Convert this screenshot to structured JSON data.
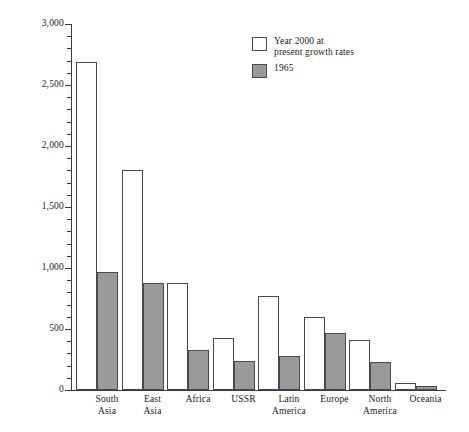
{
  "chart_data": {
    "type": "bar",
    "title": "",
    "subtitle": "",
    "xlabel": "",
    "ylabel": "Millions",
    "ylim": [
      0,
      3000
    ],
    "y_major_step": 500,
    "y_minor_step": 100,
    "grid": false,
    "legend_position": "top-right",
    "y_tick_labels": [
      "3,000",
      "2,500",
      "2,000",
      "1,500",
      "1,000",
      "500",
      "0"
    ],
    "y_tick_values": [
      3000,
      2500,
      2000,
      1500,
      1000,
      500,
      0
    ],
    "categories": [
      "South\nAsia",
      "East\nAsia",
      "Africa",
      "USSR",
      "Latin\nAmerica",
      "Europe",
      "North\nAmerica",
      "Oceania"
    ],
    "series": [
      {
        "name": "Year 2000 at\npresent growth rates",
        "color": "#ffffff",
        "values": [
          2690,
          1805,
          875,
          430,
          770,
          600,
          410,
          60
        ]
      },
      {
        "name": "1965",
        "color": "#9a9a9a",
        "values": [
          965,
          875,
          330,
          240,
          280,
          470,
          230,
          30
        ]
      }
    ]
  },
  "legend": {
    "items": [
      {
        "label": "Year 2000 at\npresent growth rates",
        "swatch": "s2000"
      },
      {
        "label": "1965",
        "swatch": "s1965"
      }
    ]
  },
  "colors": {
    "series_2000": "#ffffff",
    "series_1965": "#9a9a9a",
    "axis": "#3a3a3a",
    "outline": "#4a4a4a",
    "text": "#1a1a1a",
    "background": "#ffffff"
  }
}
